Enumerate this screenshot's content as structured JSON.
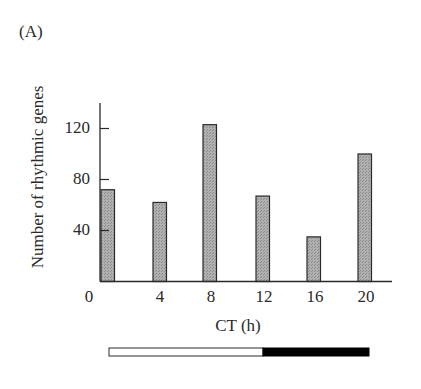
{
  "panel_label": "(A)",
  "colors": {
    "bar_fill": "#a9a9a9",
    "bar_stroke": "#2a2a2a",
    "axis": "#2a2a2a",
    "light": "#ffffff",
    "dark": "#000000"
  },
  "chart_data": {
    "type": "bar",
    "title": "",
    "xlabel": "CT (h)",
    "ylabel": "Number of rhythmic genes",
    "categories": [
      "0",
      "4",
      "8",
      "12",
      "16",
      "20"
    ],
    "values": [
      72,
      62,
      123,
      67,
      35,
      100
    ],
    "yticks": [
      40,
      80,
      120
    ],
    "ytick_labels": [
      "40",
      "80",
      "120"
    ],
    "xtick_labels": [
      "0",
      "4",
      "8",
      "12",
      "16",
      "20"
    ],
    "ylim": [
      0,
      140
    ],
    "grid": false,
    "legend": null,
    "annotations": [
      "Light/dark bar below x-axis: white (light) from CT 0 to 12, black (dark) from CT 12 to 24"
    ]
  }
}
